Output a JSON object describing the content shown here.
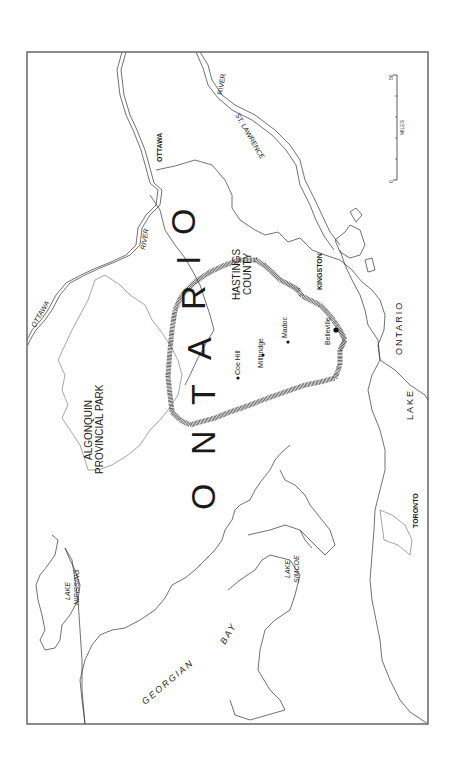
{
  "map": {
    "country_label": "ONTARIO",
    "country_letters": [
      "O",
      "N",
      "T",
      "A",
      "R",
      "I",
      "O"
    ],
    "region_label": {
      "line1": "HASTINGS",
      "line2": "COUNTY"
    },
    "park_label": {
      "line1": "ALGONQUIN",
      "line2": "PROVINCIAL PARK"
    },
    "cities": [
      {
        "name": "OTTAWA",
        "style": "bold"
      },
      {
        "name": "KINGSTON",
        "style": "bold"
      },
      {
        "name": "TORONTO",
        "style": "bold"
      }
    ],
    "towns": [
      {
        "name": "Coe Hill"
      },
      {
        "name": "Millbridge"
      },
      {
        "name": "Madoc"
      },
      {
        "name": "Belleville"
      }
    ],
    "water": {
      "ottawa_river_a": "OTTAWA",
      "ottawa_river_b": "RIVER",
      "st_lawrence_a": "ST. LAWRENCE",
      "st_lawrence_b": "RIVER",
      "lake_nipissing": {
        "line1": "LAKE",
        "line2": "NIPISSING"
      },
      "georgian_bay_a": "GEORGIAN",
      "georgian_bay_b": "BAY",
      "lake_simcoe": {
        "line1": "LAKE",
        "line2": "SIMCOE"
      },
      "lake_ontario_a": "LAKE",
      "lake_ontario_b": "ONTARIO"
    },
    "scale_bar": {
      "min": "0",
      "max": "50",
      "unit": "MILES"
    },
    "colors": {
      "line": "#333333",
      "frame": "#777777",
      "background": "#ffffff"
    }
  }
}
